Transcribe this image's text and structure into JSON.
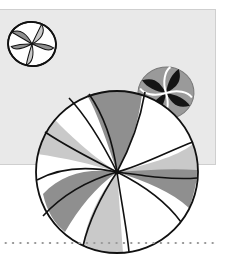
{
  "illustration": {
    "subject": "peppermint candies",
    "colors": {
      "panel": "#e9e9e9",
      "panel_border": "#cfcfcf",
      "stroke": "#111111",
      "dark_swirl": "#8f8f8f",
      "light_swirl": "#c9c9c9",
      "white": "#ffffff",
      "black_swirl": "#141414",
      "dots": "#9a9a9a"
    },
    "candies": [
      {
        "name": "small-candy-top-left",
        "cx": 32,
        "cy": 44,
        "r": 24
      },
      {
        "name": "small-candy-right",
        "cx": 166,
        "cy": 93,
        "r": 28
      },
      {
        "name": "large-candy",
        "cx": 117,
        "cy": 172,
        "r": 81
      }
    ]
  }
}
